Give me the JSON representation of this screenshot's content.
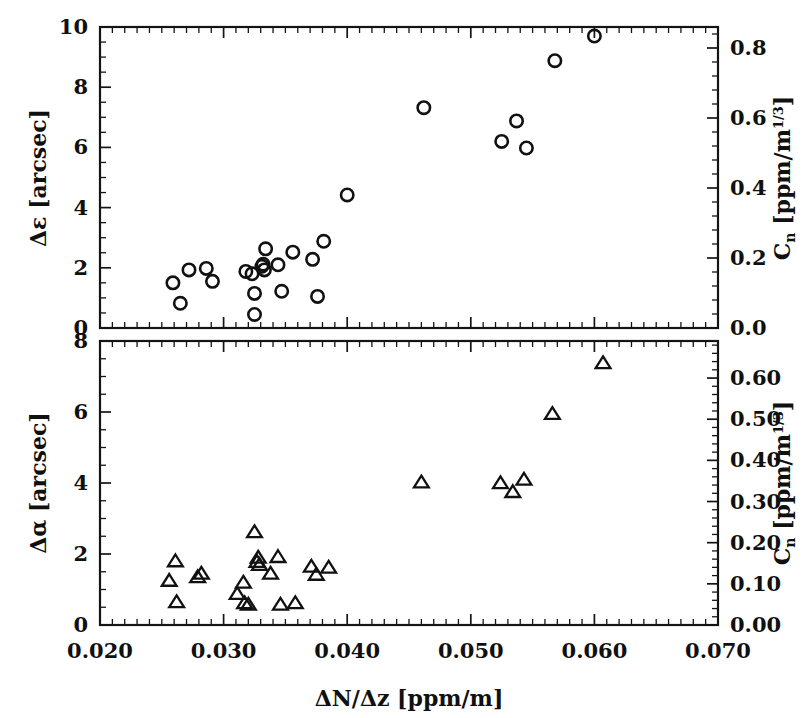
{
  "figure": {
    "title": "",
    "background_color": "#ffffff",
    "ink_color": "#111111",
    "panel_count": 2
  },
  "axes": {
    "x_label": "ΔN/Δz [ppm/m]",
    "x_ticklabels": [
      "0.020",
      "0.030",
      "0.040",
      "0.050",
      "0.060",
      "0.070"
    ],
    "x_tickvalues": [
      0.02,
      0.03,
      0.04,
      0.05,
      0.06,
      0.07
    ],
    "x_range": [
      0.02,
      0.07
    ],
    "x_minor_per_major": 10,
    "top_left_label": "Δε [arcsec]",
    "top_left_ticklabels": [
      "0",
      "2",
      "4",
      "6",
      "8",
      "10"
    ],
    "top_left_tickvalues": [
      0,
      2,
      4,
      6,
      8,
      10
    ],
    "top_left_range": [
      0,
      10
    ],
    "top_right_label_main": "C",
    "top_right_label_sub": "n",
    "top_right_label_unit": "[ppm/m",
    "top_right_label_exp": "1/3",
    "top_right_label_close": "]",
    "top_right_label_full": "Cₙ [ppm/m¹ᐟ³]",
    "top_right_ticklabels": [
      "0.0",
      "0.2",
      "0.4",
      "0.6",
      "0.8"
    ],
    "top_right_tickvalues": [
      0.0,
      0.2,
      0.4,
      0.6,
      0.8
    ],
    "top_right_range": [
      0.0,
      0.86
    ],
    "bottom_left_label": "Δα [arcsec]",
    "bottom_left_ticklabels": [
      "0",
      "2",
      "4",
      "6",
      "8"
    ],
    "bottom_left_tickvalues": [
      0,
      2,
      4,
      6,
      8
    ],
    "bottom_left_range": [
      0,
      8
    ],
    "bottom_right_ticklabels": [
      "0.00",
      "0.10",
      "0.20",
      "0.30",
      "0.40",
      "0.50",
      "0.60"
    ],
    "bottom_right_tickvalues": [
      0.0,
      0.1,
      0.2,
      0.3,
      0.4,
      0.5,
      0.6
    ],
    "bottom_right_range": [
      0.0,
      0.69
    ]
  },
  "chart_data": [
    {
      "type": "scatter",
      "panel": "top",
      "title": "",
      "xlabel": "ΔN/Δz [ppm/m]",
      "ylabel": "Δε [arcsec]",
      "ylabel_right": "Cₙ [ppm/m¹ᐟ³]",
      "marker": "open-circle",
      "xlim": [
        0.02,
        0.07
      ],
      "ylim": [
        0,
        10
      ],
      "ylim_right": [
        0.0,
        0.86
      ],
      "grid": false,
      "legend": "none",
      "points": [
        {
          "x": 0.0259,
          "y": 1.5
        },
        {
          "x": 0.0265,
          "y": 0.82
        },
        {
          "x": 0.0272,
          "y": 1.93
        },
        {
          "x": 0.0286,
          "y": 1.98
        },
        {
          "x": 0.0291,
          "y": 1.55
        },
        {
          "x": 0.0318,
          "y": 1.88
        },
        {
          "x": 0.0323,
          "y": 1.8
        },
        {
          "x": 0.0325,
          "y": 1.15
        },
        {
          "x": 0.0325,
          "y": 0.45
        },
        {
          "x": 0.0331,
          "y": 2.05
        },
        {
          "x": 0.0332,
          "y": 2.12
        },
        {
          "x": 0.0333,
          "y": 1.93
        },
        {
          "x": 0.0334,
          "y": 2.63
        },
        {
          "x": 0.0344,
          "y": 2.1
        },
        {
          "x": 0.0347,
          "y": 1.22
        },
        {
          "x": 0.0356,
          "y": 2.52
        },
        {
          "x": 0.0372,
          "y": 2.28
        },
        {
          "x": 0.0376,
          "y": 1.05
        },
        {
          "x": 0.0381,
          "y": 2.88
        },
        {
          "x": 0.04,
          "y": 4.42
        },
        {
          "x": 0.0462,
          "y": 7.32
        },
        {
          "x": 0.0525,
          "y": 6.2
        },
        {
          "x": 0.0537,
          "y": 6.88
        },
        {
          "x": 0.0545,
          "y": 5.98
        },
        {
          "x": 0.0568,
          "y": 8.88
        },
        {
          "x": 0.06,
          "y": 9.7
        }
      ]
    },
    {
      "type": "scatter",
      "panel": "bottom",
      "title": "",
      "xlabel": "ΔN/Δz [ppm/m]",
      "ylabel": "Δα [arcsec]",
      "ylabel_right": "Cₙ [ppm/m¹ᐟ³]",
      "marker": "open-triangle",
      "xlim": [
        0.02,
        0.07
      ],
      "ylim": [
        0,
        8
      ],
      "ylim_right": [
        0.0,
        0.69
      ],
      "grid": false,
      "legend": "none",
      "points": [
        {
          "x": 0.0256,
          "y": 1.25
        },
        {
          "x": 0.0261,
          "y": 1.8
        },
        {
          "x": 0.0262,
          "y": 0.65
        },
        {
          "x": 0.0279,
          "y": 1.35
        },
        {
          "x": 0.0282,
          "y": 1.45
        },
        {
          "x": 0.0311,
          "y": 0.88
        },
        {
          "x": 0.0316,
          "y": 1.2
        },
        {
          "x": 0.0317,
          "y": 0.62
        },
        {
          "x": 0.032,
          "y": 0.58
        },
        {
          "x": 0.0325,
          "y": 2.62
        },
        {
          "x": 0.0327,
          "y": 1.78
        },
        {
          "x": 0.0328,
          "y": 1.9
        },
        {
          "x": 0.0329,
          "y": 1.7
        },
        {
          "x": 0.0338,
          "y": 1.45
        },
        {
          "x": 0.0344,
          "y": 1.92
        },
        {
          "x": 0.0346,
          "y": 0.58
        },
        {
          "x": 0.0358,
          "y": 0.62
        },
        {
          "x": 0.0371,
          "y": 1.65
        },
        {
          "x": 0.0375,
          "y": 1.42
        },
        {
          "x": 0.0385,
          "y": 1.62
        },
        {
          "x": 0.046,
          "y": 4.02
        },
        {
          "x": 0.0524,
          "y": 4.0
        },
        {
          "x": 0.0534,
          "y": 3.75
        },
        {
          "x": 0.0543,
          "y": 4.1
        },
        {
          "x": 0.0566,
          "y": 5.95
        },
        {
          "x": 0.0607,
          "y": 7.38
        }
      ]
    }
  ]
}
